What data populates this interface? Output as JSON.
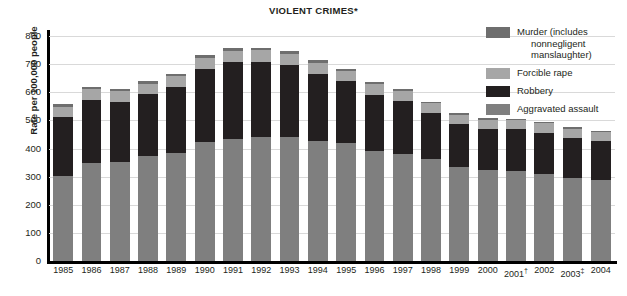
{
  "chart_data": {
    "type": "bar",
    "stacked": true,
    "title": "VIOLENT CRIMES*",
    "title_symbol": "*",
    "xlabel": "",
    "ylabel": "Rate per 100,000 people",
    "ylim": [
      0,
      800
    ],
    "ytick_values": [
      0,
      100,
      200,
      300,
      400,
      500,
      600,
      700,
      800
    ],
    "ytick_labels": [
      "0",
      "100",
      "200",
      "300",
      "400",
      "500",
      "600",
      "700",
      "800"
    ],
    "grid": true,
    "legend_position": "top-right",
    "categories": [
      "1985",
      "1986",
      "1987",
      "1988",
      "1989",
      "1990",
      "1991",
      "1992",
      "1993",
      "1994",
      "1995",
      "1996",
      "1997",
      "1998",
      "1999",
      "2000",
      "2001",
      "2002",
      "2003",
      "2004"
    ],
    "category_footnotes": {
      "2001": "†",
      "2003": "‡"
    },
    "series": [
      {
        "name": "Aggravated assault",
        "color": "#7f7f7f",
        "values": [
          303,
          347,
          352,
          372,
          385,
          424,
          433,
          442,
          440,
          427,
          418,
          391,
          382,
          361,
          336,
          324,
          319,
          310,
          295,
          289
        ]
      },
      {
        "name": "Robbery",
        "color": "#231f20",
        "values": [
          209,
          226,
          213,
          221,
          234,
          257,
          273,
          264,
          256,
          238,
          221,
          201,
          186,
          166,
          150,
          145,
          149,
          146,
          142,
          137
        ]
      },
      {
        "name": "Forcible rape",
        "color": "#a6a6a6",
        "values": [
          37,
          38,
          38,
          38,
          38,
          41,
          42,
          43,
          41,
          39,
          37,
          36,
          36,
          34,
          33,
          32,
          32,
          33,
          32,
          32
        ]
      },
      {
        "name": "Murder (includes nonnegligent manslaughter)",
        "color": "#6e6e6e",
        "values": [
          8,
          9,
          8,
          8,
          9,
          9,
          10,
          9,
          10,
          9,
          8,
          7,
          7,
          6,
          6,
          6,
          6,
          6,
          6,
          6
        ]
      }
    ],
    "totals": [
      557,
      620,
      611,
      639,
      666,
      731,
      758,
      758,
      747,
      713,
      684,
      635,
      611,
      567,
      525,
      507,
      506,
      495,
      475,
      464
    ]
  },
  "legend": {
    "entries": [
      {
        "label_line1": "Murder (includes",
        "label_line2": "nonnegligent",
        "label_line3": "manslaughter)",
        "color": "#6e6e6e",
        "swatch_name": "murder-swatch"
      },
      {
        "label_line1": "Forcible rape",
        "label_line2": "",
        "label_line3": "",
        "color": "#a6a6a6",
        "swatch_name": "forcible-rape-swatch"
      },
      {
        "label_line1": "Robbery",
        "label_line2": "",
        "label_line3": "",
        "color": "#231f20",
        "swatch_name": "robbery-swatch"
      },
      {
        "label_line1": "Aggravated assault",
        "label_line2": "",
        "label_line3": "",
        "color": "#7f7f7f",
        "swatch_name": "aggravated-assault-swatch"
      }
    ]
  }
}
